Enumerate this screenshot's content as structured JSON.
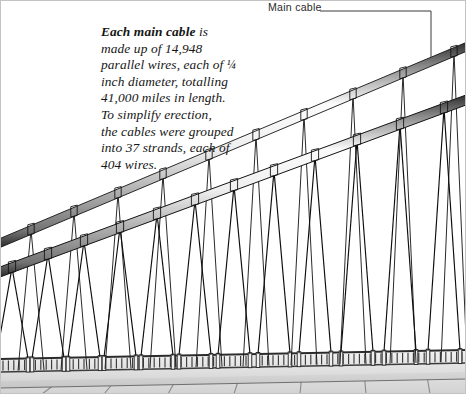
{
  "figure": {
    "background_color": "#ffffff",
    "width": 466,
    "height": 394
  },
  "annotations": {
    "main_cable_label": "Main cable",
    "leader": {
      "horizontal_start_x": 320,
      "horizontal_end_x": 431,
      "y": 11,
      "vertical_end_y": 57
    }
  },
  "caption": {
    "lead_in": "Each main cable",
    "body_line1": " is",
    "body_line2": "made up of 14,948",
    "body_line3": "parallel wires, each of ",
    "fraction": "¼",
    "body_line4": "inch diameter, totalling",
    "body_line5": "41,000 miles in length.",
    "body_line6": "To simplify erection,",
    "body_line7": "the cables were grouped",
    "body_line8": "into 37 strands, each of",
    "body_line9": "404 wires.",
    "full_text": "Each main cable is made up of 14,948 parallel wires, each of ¼ inch diameter, totalling 41,000 miles in length. To simplify erection, the cables were grouped into 37 strands, each of 404 wires."
  },
  "facts": {
    "parallel_wires": "14,948",
    "wire_diameter_inches": "¼",
    "total_wire_length_miles": "41,000",
    "strand_count": "37",
    "wires_per_strand": "404"
  },
  "colors": {
    "ink": "#161616",
    "cable_outline": "#1a1a1a",
    "cable_light": "#f4f4f4",
    "cable_mid": "#b8b8b8",
    "cable_shadow": "#6e6e6e",
    "suspender": "#111111",
    "deck_top": "#cfcfcf",
    "deck_face": "#d8d8d8",
    "railing": "#e8e8e8",
    "frame": "#b0b0b0"
  },
  "geometry": {
    "near_cable": {
      "x1": 0,
      "y1": 272,
      "x2": 466,
      "y2": 100,
      "thickness": 9
    },
    "far_cable": {
      "x1": 0,
      "y1": 243,
      "x2": 466,
      "y2": 47,
      "thickness": 9
    },
    "deck_line_y_left": 371,
    "deck_line_y_right": 362,
    "near_suspender_anchor_xs": [
      12,
      48,
      84,
      120,
      157,
      195,
      234,
      274,
      315,
      357,
      400,
      444
    ],
    "far_suspender_anchor_xs": [
      31,
      74,
      118,
      163,
      209,
      256,
      304,
      353,
      403,
      454
    ]
  }
}
